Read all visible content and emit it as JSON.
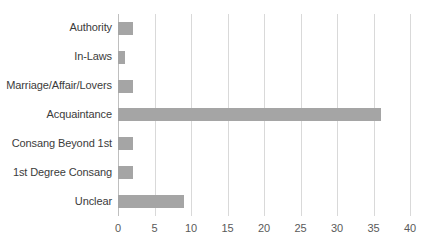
{
  "chart_data": {
    "type": "bar",
    "orientation": "horizontal",
    "title": "",
    "subtitle": "",
    "xlabel": "",
    "ylabel": "",
    "categories": [
      "Authority",
      "In-Laws",
      "Marriage/Affair/Lovers",
      "Acquaintance",
      "Consang Beyond 1st",
      "1st Degree Consang",
      "Unclear"
    ],
    "values": [
      2,
      1,
      2,
      36,
      2,
      2,
      9
    ],
    "xticks": [
      0,
      5,
      10,
      15,
      20,
      25,
      30,
      35,
      40
    ],
    "xtick_labels": [
      "0",
      "5",
      "10",
      "15",
      "20",
      "25",
      "30",
      "35",
      "40"
    ],
    "xlim": [
      0,
      40
    ],
    "grid": "vertical",
    "legend": null,
    "bar_color": "#a5a5a5",
    "gridline_color": "#d9d9d9",
    "axis_color": "#bfbfbf",
    "label_color": "#3b3b3b",
    "tick_label_color": "#5a5a5a",
    "background_color": "#ffffff"
  }
}
